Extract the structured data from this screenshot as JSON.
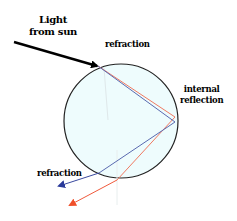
{
  "diagram": {
    "labels": {
      "light_from_sun_line1": "Light",
      "light_from_sun_line2": "from sun",
      "refraction_top": "refraction",
      "internal_line1": "internal",
      "internal_line2": "reflection",
      "refraction_bottom": "refraction"
    },
    "colors": {
      "droplet_fill": "#eefcfd",
      "droplet_stroke": "#222222",
      "incoming_ray": "#000000",
      "red_ray": "#f05a3c",
      "blue_ray": "#3a4aa0"
    },
    "nodes": [
      {
        "id": "sun-light",
        "label": "Light from sun"
      },
      {
        "id": "droplet",
        "label": "water droplet"
      },
      {
        "id": "entry",
        "label": "refraction"
      },
      {
        "id": "back",
        "label": "internal reflection"
      },
      {
        "id": "exit",
        "label": "refraction"
      }
    ],
    "edges": [
      {
        "from": "sun-light",
        "to": "entry",
        "color": "black"
      },
      {
        "from": "entry",
        "to": "back",
        "color": "red"
      },
      {
        "from": "entry",
        "to": "back",
        "color": "blue"
      },
      {
        "from": "back",
        "to": "exit",
        "color": "red"
      },
      {
        "from": "back",
        "to": "exit",
        "color": "blue"
      }
    ]
  }
}
